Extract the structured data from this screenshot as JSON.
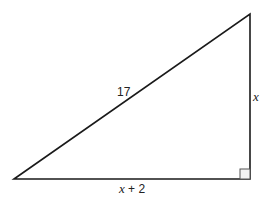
{
  "diagram": {
    "type": "right-triangle",
    "hypotenuse_label": "17",
    "vertical_leg_label": "x",
    "horizontal_leg_label_var": "x",
    "horizontal_leg_label_rest": " + 2",
    "right_angle_marker": true,
    "stroke_color": "#1a1a1a"
  }
}
